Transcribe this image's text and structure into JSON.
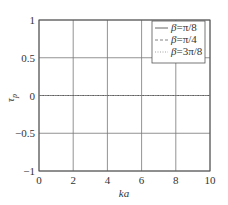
{
  "chart_data": {
    "type": "line",
    "title": "",
    "xlabel": "ka",
    "ylabel": "τ_p",
    "xlim": [
      0,
      10
    ],
    "ylim": [
      -1,
      1
    ],
    "xticks": [
      0,
      2,
      4,
      6,
      8,
      10
    ],
    "yticks": [
      1,
      0.5,
      0,
      -0.5,
      -1
    ],
    "xtick_labels": [
      "0",
      "2",
      "4",
      "6",
      "8",
      "10"
    ],
    "ytick_labels": [
      "1",
      "0.5",
      "0",
      "−0.5",
      "−1"
    ],
    "grid": true,
    "legend_position": "upper right",
    "x": [
      0,
      2,
      4,
      6,
      8,
      10
    ],
    "series": [
      {
        "name": "β=π/8",
        "style": "solid",
        "values": [
          0,
          0,
          0,
          0,
          0,
          0
        ]
      },
      {
        "name": "β=π/4",
        "style": "dashed",
        "values": [
          0,
          0,
          0,
          0,
          0,
          0
        ]
      },
      {
        "name": "β=3π/8",
        "style": "dotted",
        "values": [
          0,
          0,
          0,
          0,
          0,
          0
        ]
      }
    ]
  },
  "axes": {
    "xlabel": "ka",
    "ylabel_main": "τ",
    "ylabel_sub": "p"
  },
  "legend": {
    "items": [
      {
        "label_sym": "β",
        "label_rest": "=π/8"
      },
      {
        "label_sym": "β",
        "label_rest": "=π/4"
      },
      {
        "label_sym": "β",
        "label_rest": "=3π/8"
      }
    ]
  },
  "colors": {
    "axes": "#555555",
    "grid": "#777777",
    "series": [
      "#555555",
      "#777777",
      "#999999"
    ]
  }
}
